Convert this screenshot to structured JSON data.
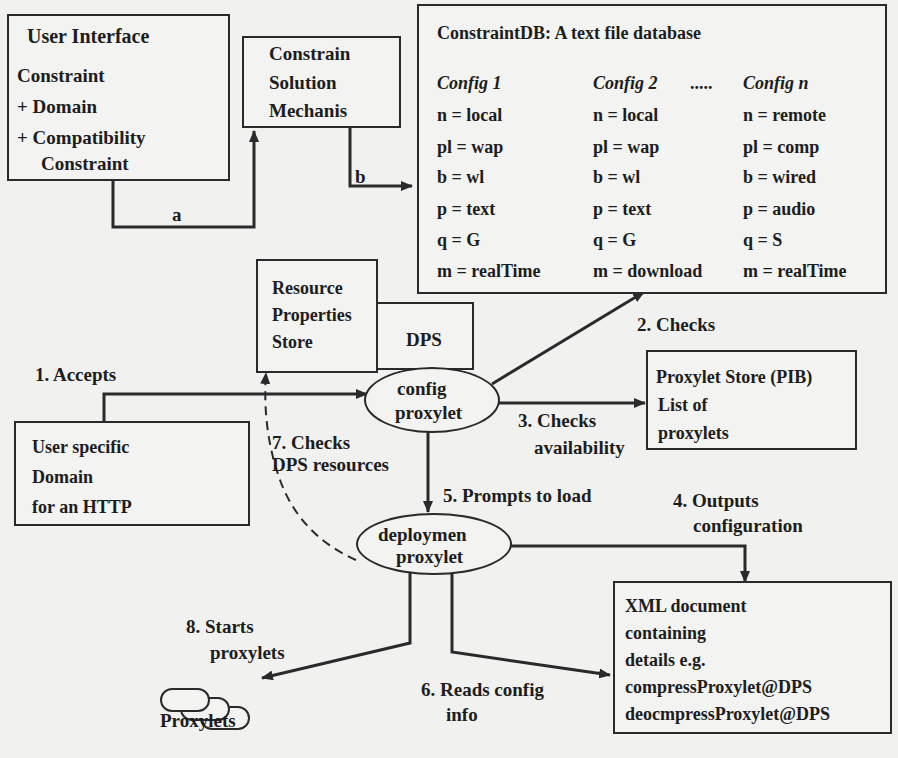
{
  "user_interface": {
    "title": "User Interface",
    "lines": [
      "Constraint",
      "+ Domain",
      "+ Compatibility",
      "Constraint"
    ]
  },
  "solution_mechanism": {
    "lines": [
      "Constrain",
      "Solution",
      "Mechanis"
    ]
  },
  "constraint_db": {
    "title": "ConstraintDB: A text file database",
    "headers": [
      "Config 1",
      "Config 2",
      ".....",
      "Config n"
    ],
    "configs": [
      [
        "n = local",
        "pl = wap",
        "b = wl",
        "p = text",
        "q = G",
        "m = realTime"
      ],
      [
        "n = local",
        "pl = wap",
        "b = wl",
        "p = text",
        "q = G",
        "m = download"
      ],
      [
        "n = remote",
        "pl = comp",
        "b = wired",
        "p = audio",
        "q = S",
        "m = realTime"
      ]
    ]
  },
  "resource_store": {
    "lines": [
      "Resource",
      "Properties",
      "Store"
    ]
  },
  "dps": {
    "label": "DPS"
  },
  "config_proxylet": {
    "lines": [
      "config",
      "proxylet"
    ]
  },
  "proxylet_store": {
    "lines": [
      "Proxylet Store (PIB)",
      "List of",
      "proxylets"
    ]
  },
  "user_domain": {
    "lines": [
      "User specific",
      "Domain",
      "for an HTTP"
    ]
  },
  "deployment_proxylet": {
    "lines": [
      "deploymen",
      "proxylet"
    ]
  },
  "xml_doc": {
    "lines": [
      "XML document",
      "containing",
      "details e.g.",
      "compressProxylet@DPS",
      "deocmpressProxylet@DPS"
    ]
  },
  "proxylets": {
    "label": "Proxylets"
  },
  "edges": {
    "a": "a",
    "b": "b",
    "accepts": "1. Accepts",
    "checks": "2. Checks",
    "checks_availability": [
      "3. Checks",
      "availability"
    ],
    "outputs_config": [
      "4. Outputs",
      "configuration"
    ],
    "prompts_load": "5. Prompts to load",
    "reads_config": [
      "6. Reads config",
      "info"
    ],
    "checks_dps": [
      "7. Checks",
      "DPS resources"
    ],
    "starts_proxylets": [
      "8. Starts",
      "proxylets"
    ]
  },
  "colors": {
    "background": "#f1f1ef",
    "stroke": "#2a2a2a",
    "text": "#1d1d1d"
  }
}
